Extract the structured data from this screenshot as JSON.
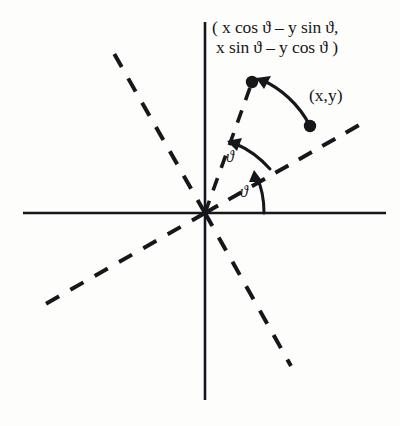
{
  "figure": {
    "name": "rotation-of-a-point-diagram",
    "background_color": "#fdfdfc",
    "ink_color": "#17161a",
    "axes": {
      "origin": [
        205,
        213
      ],
      "x_axis": {
        "from": [
          23,
          213
        ],
        "to": [
          386,
          213
        ]
      },
      "y_axis": {
        "from": [
          205,
          22
        ],
        "to": [
          205,
          400
        ]
      }
    },
    "labels": {
      "rotated_point_line1": "( x cos ϑ – y sin ϑ,",
      "rotated_point_line2": "x sin ϑ – y cos ϑ )",
      "original_point": "(x,y)",
      "angle_upper": "ϑ",
      "angle_lower": "ϑ"
    },
    "points": [
      {
        "name": "rotated-point",
        "label": "( x cos ϑ – y sin ϑ, x sin ϑ – y cos ϑ )",
        "at": [
          252,
          82
        ]
      },
      {
        "name": "original-point",
        "label": "(x,y)",
        "at": [
          310,
          126
        ]
      }
    ],
    "dashed_rays": [
      {
        "name": "ray-upper-left",
        "from": [
          205,
          213
        ],
        "to": [
          112,
          50
        ]
      },
      {
        "name": "ray-lower-left",
        "from": [
          205,
          213
        ],
        "to": [
          42,
          306
        ]
      },
      {
        "name": "ray-lower-right",
        "from": [
          205,
          213
        ],
        "to": [
          291,
          366
        ]
      },
      {
        "name": "ray-through-original-point",
        "from": [
          205,
          213
        ],
        "to": [
          361,
          124
        ]
      },
      {
        "name": "ray-through-rotated-point",
        "from": [
          205,
          213
        ],
        "to": [
          252,
          82
        ]
      }
    ],
    "arcs": [
      {
        "name": "rotation-arrow-between-points",
        "from": [
          310,
          126
        ],
        "to": [
          252,
          82
        ]
      },
      {
        "name": "angle-arc-upper",
        "from": [
          268,
          168
        ],
        "to": [
          228,
          143
        ]
      },
      {
        "name": "angle-arc-lower",
        "from": [
          264,
          213
        ],
        "to": [
          257,
          172
        ]
      }
    ]
  }
}
